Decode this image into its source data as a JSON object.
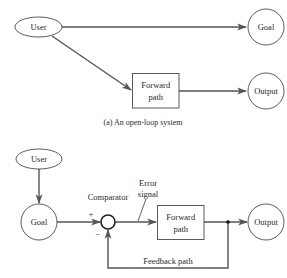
{
  "diagram_a": {
    "caption": "(a) An open-loop system",
    "nodes": {
      "user": "User",
      "goal": "Goal",
      "forward_line1": "Forward",
      "forward_line2": "path",
      "output": "Output"
    },
    "edges": [
      {
        "from": "User",
        "to": "Goal"
      },
      {
        "from": "User",
        "to": "Forward path"
      },
      {
        "from": "Forward path",
        "to": "Output"
      }
    ]
  },
  "diagram_b": {
    "nodes": {
      "user": "User",
      "goal": "Goal",
      "comparator": "Comparator",
      "plus": "+",
      "minus": "−",
      "error_line1": "Error",
      "error_line2": "signal",
      "forward_line1": "Forward",
      "forward_line2": "path",
      "output": "Output",
      "feedback": "Feedback path"
    },
    "edges": [
      {
        "from": "User",
        "to": "Goal"
      },
      {
        "from": "Goal",
        "to": "Comparator",
        "sign": "+"
      },
      {
        "from": "Comparator",
        "to": "Forward path"
      },
      {
        "from": "Forward path",
        "to": "Output"
      },
      {
        "from": "Output",
        "to": "Comparator",
        "label": "Feedback path",
        "sign": "-"
      }
    ]
  },
  "colors": {
    "line": "#555555",
    "shape_stroke": "#4a4a4a",
    "text": "#2a2a2a",
    "background": "#ffffff"
  }
}
